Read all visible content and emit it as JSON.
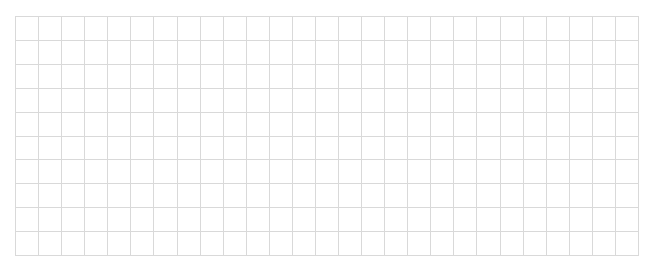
{
  "grid": {
    "columns": 27,
    "rows": 10,
    "line_color": "#d9d9d9",
    "background_color": "#ffffff"
  }
}
